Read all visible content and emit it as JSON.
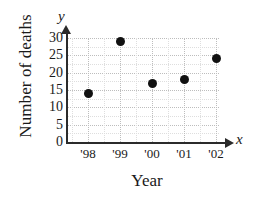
{
  "chart_data": {
    "type": "scatter",
    "title": "",
    "xlabel": "Year",
    "ylabel": "Number of deaths",
    "x_axis_name": "x",
    "y_axis_name": "y",
    "categories": [
      "'98",
      "'99",
      "'00",
      "'01",
      "'02"
    ],
    "values": [
      14,
      29,
      17,
      18,
      24
    ],
    "points": [
      {
        "label": "'98",
        "x": 1998,
        "y": 14
      },
      {
        "label": "'99",
        "x": 1999,
        "y": 29
      },
      {
        "label": "'00",
        "x": 2000,
        "y": 17
      },
      {
        "label": "'01",
        "x": 2001,
        "y": 18
      },
      {
        "label": "'02",
        "x": 2002,
        "y": 24
      }
    ],
    "ylim": [
      0,
      32
    ],
    "yticks": [
      0,
      5,
      10,
      15,
      20,
      25,
      30
    ],
    "ytick_labels": [
      "0",
      "5",
      "10",
      "15",
      "20",
      "25",
      "30"
    ],
    "xtick_labels": [
      "'98",
      "'99",
      "'00",
      "'01",
      "'02"
    ],
    "grid": true,
    "grid_style": "dotted",
    "legend": "none",
    "marker_color": "#111111",
    "axis_color": "#2b2b2b",
    "grid_color": "#bdbdbd"
  }
}
